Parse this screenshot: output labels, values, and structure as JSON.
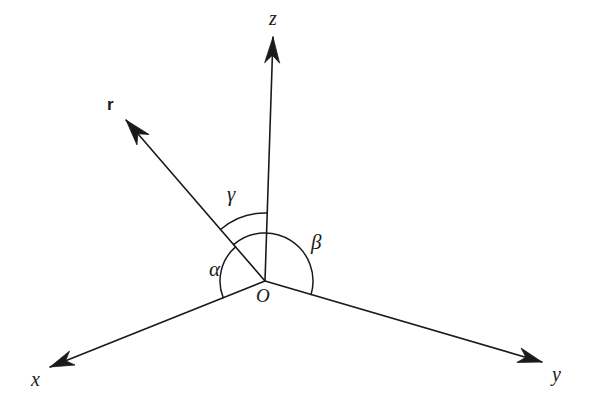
{
  "figure": {
    "background_color": "#ffffff",
    "ink_color": "#1a1a1a",
    "width": 590,
    "height": 407
  },
  "origin": {
    "label": "O",
    "x": 265,
    "y": 281
  },
  "axes": [
    {
      "key": "x",
      "label": "x",
      "tip_x": 50,
      "tip_y": 367,
      "label_x": 31,
      "label_y": 369,
      "arrow": true
    },
    {
      "key": "y",
      "label": "y",
      "tip_x": 542,
      "tip_y": 362,
      "label_x": 552,
      "label_y": 364,
      "arrow": true
    },
    {
      "key": "z",
      "label": "z",
      "tip_x": 273,
      "tip_y": 37,
      "label_x": 269,
      "label_y": 8,
      "arrow": true
    }
  ],
  "vector": {
    "key": "r",
    "label": "r",
    "tip_x": 126,
    "tip_y": 120,
    "label_x": 107,
    "label_y": 96,
    "bold": true,
    "arrow": true
  },
  "angles": [
    {
      "key": "alpha",
      "label": "α",
      "from_axis": "x",
      "to_ray": "r",
      "radius": 45,
      "label_x": 209,
      "label_y": 259
    },
    {
      "key": "beta",
      "label": "β",
      "from_axis": "y",
      "to_ray": "r",
      "radius": 48,
      "label_x": 311,
      "label_y": 232
    },
    {
      "key": "gamma",
      "label": "γ",
      "from_axis": "z",
      "to_ray": "r",
      "radius": 68,
      "label_x": 227,
      "label_y": 184
    }
  ]
}
